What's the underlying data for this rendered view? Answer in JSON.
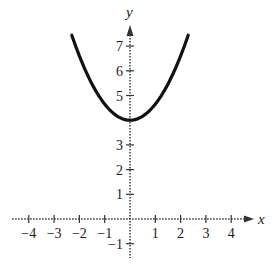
{
  "chart_data": {
    "type": "line",
    "title": "",
    "xlabel": "x",
    "ylabel": "y",
    "xlim": [
      -4.5,
      4.8
    ],
    "ylim": [
      -1.6,
      8.0
    ],
    "x_ticks": [
      -4,
      -3,
      -2,
      -1,
      1,
      2,
      3,
      4
    ],
    "y_ticks": [
      -1,
      1,
      2,
      3,
      5,
      6,
      7
    ],
    "x_tick_labels": [
      "−4",
      "−3",
      "−2",
      "−1",
      "1",
      "2",
      "3",
      "4"
    ],
    "y_tick_labels": [
      "−1",
      "1",
      "2",
      "3",
      "5",
      "6",
      "7"
    ],
    "grid": false,
    "series": [
      {
        "name": "parabola",
        "description": "Upward-opening parabola with vertex at (0, 4)",
        "vertex": [
          0,
          4
        ],
        "x_range": [
          -2.3,
          2.3
        ],
        "approx_equation": "y = 0.65x^2 + 4",
        "x": [
          -2.3,
          -2,
          -1.5,
          -1,
          -0.5,
          0,
          0.5,
          1,
          1.5,
          2,
          2.3
        ],
        "y": [
          7.44,
          6.6,
          5.46,
          4.65,
          4.16,
          4.0,
          4.16,
          4.65,
          5.46,
          6.6,
          7.44
        ]
      }
    ],
    "colors": {
      "curve": "#111111",
      "axis": "#333333"
    }
  },
  "layout": {
    "origin_px": [
      130,
      219
    ],
    "unit_x_px": 25.3,
    "unit_y_px": 24.7
  }
}
